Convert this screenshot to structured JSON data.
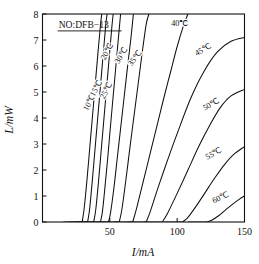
{
  "figure": {
    "annotation": "NO:DFB−13",
    "background": "#ffffff",
    "line_color": "#111111"
  },
  "chart_data": {
    "type": "line",
    "title": "",
    "subtitle": "",
    "xlabel": "I/mA",
    "ylabel": "L/mW",
    "xlim": [
      0,
      150
    ],
    "ylim": [
      0,
      8
    ],
    "xticks": [
      50,
      100,
      150
    ],
    "xtick_labels": [
      "50",
      "100",
      "150"
    ],
    "yticks": [
      0,
      1,
      2,
      3,
      4,
      5,
      6,
      7,
      8
    ],
    "ytick_labels": [
      "0",
      "1",
      "2",
      "3",
      "4",
      "5",
      "6",
      "7",
      "8"
    ],
    "grid": false,
    "legend": "inline-curve-labels",
    "annotations": [
      {
        "text": "NO:DFB−13",
        "x": 12,
        "y": 7.45,
        "underline": true
      }
    ],
    "series": [
      {
        "name": "10°C",
        "label": "10℃",
        "threshold_mA": 29.5,
        "slope_mW_per_mA": 0.62,
        "label_x": 36.5,
        "label_y": 4.55,
        "label_rotation": -61,
        "points": [
          [
            29.5,
            0
          ],
          [
            31,
            0.55
          ],
          [
            33,
            1.6
          ],
          [
            35,
            2.8
          ],
          [
            37,
            4.0
          ],
          [
            39,
            5.2
          ],
          [
            41,
            6.4
          ],
          [
            43,
            7.55
          ],
          [
            44,
            8.0
          ]
        ]
      },
      {
        "name": "15°C",
        "label": "15℃",
        "threshold_mA": 33.5,
        "slope_mW_per_mA": 0.6,
        "label_x": 41.5,
        "label_y": 5.1,
        "label_rotation": -61,
        "points": [
          [
            33.5,
            0
          ],
          [
            35,
            0.5
          ],
          [
            37,
            1.6
          ],
          [
            39,
            2.8
          ],
          [
            41,
            4.0
          ],
          [
            43,
            5.2
          ],
          [
            45,
            6.4
          ],
          [
            47,
            7.6
          ],
          [
            48,
            8.0
          ]
        ]
      },
      {
        "name": "20°C",
        "label": "20℃",
        "threshold_mA": 38,
        "slope_mW_per_mA": 0.585,
        "label_x": 49.5,
        "label_y": 6.5,
        "label_rotation": -61,
        "points": [
          [
            38,
            0
          ],
          [
            39.5,
            0.45
          ],
          [
            41.5,
            1.5
          ],
          [
            43.5,
            2.7
          ],
          [
            45.5,
            3.9
          ],
          [
            47.5,
            5.1
          ],
          [
            49.5,
            6.3
          ],
          [
            51.5,
            7.5
          ],
          [
            52.5,
            8.0
          ]
        ]
      },
      {
        "name": "25°C",
        "label": "25℃",
        "threshold_mA": 43,
        "slope_mW_per_mA": 0.555,
        "label_x": 49,
        "label_y": 5.0,
        "label_rotation": -61,
        "points": [
          [
            43,
            0
          ],
          [
            44.5,
            0.4
          ],
          [
            46.5,
            1.4
          ],
          [
            48.5,
            2.5
          ],
          [
            50.5,
            3.7
          ],
          [
            52.5,
            4.85
          ],
          [
            54.5,
            6.0
          ],
          [
            56.5,
            7.15
          ],
          [
            58,
            8.0
          ]
        ]
      },
      {
        "name": "30°C",
        "label": "30℃",
        "threshold_mA": 49,
        "slope_mW_per_mA": 0.52,
        "label_x": 60,
        "label_y": 6.35,
        "label_rotation": -58,
        "points": [
          [
            49,
            0
          ],
          [
            50.5,
            0.35
          ],
          [
            53,
            1.3
          ],
          [
            55.5,
            2.45
          ],
          [
            58,
            3.6
          ],
          [
            60.5,
            4.75
          ],
          [
            63,
            5.9
          ],
          [
            65.5,
            7.0
          ],
          [
            67.5,
            8.0
          ]
        ]
      },
      {
        "name": "35°C",
        "label": "35℃",
        "threshold_mA": 57,
        "slope_mW_per_mA": 0.46,
        "label_x": 70,
        "label_y": 6.25,
        "label_rotation": -55,
        "points": [
          [
            57,
            0
          ],
          [
            59,
            0.5
          ],
          [
            62,
            1.65
          ],
          [
            65,
            2.9
          ],
          [
            68,
            4.1
          ],
          [
            71,
            5.3
          ],
          [
            74,
            6.5
          ],
          [
            77,
            7.6
          ],
          [
            79,
            8.0
          ]
        ]
      },
      {
        "name": "40°C",
        "label": "40℃",
        "threshold_mA": 67,
        "slope_mW_per_mA": 0.385,
        "label_x": 102,
        "label_y": 7.55,
        "label_rotation": 0,
        "points": [
          [
            67,
            0
          ],
          [
            70,
            0.55
          ],
          [
            75,
            1.6
          ],
          [
            80,
            2.65
          ],
          [
            85,
            3.7
          ],
          [
            90,
            4.75
          ],
          [
            95,
            5.75
          ],
          [
            100,
            6.75
          ],
          [
            105,
            7.6
          ],
          [
            108,
            8.0
          ]
        ]
      },
      {
        "name": "45°C",
        "label": "45℃",
        "threshold_mA": 77,
        "slope_mW_per_mA": 0.3,
        "label_x": 120,
        "label_y": 6.55,
        "label_rotation": -30,
        "points": [
          [
            77,
            0
          ],
          [
            80,
            0.4
          ],
          [
            86,
            1.35
          ],
          [
            93,
            2.4
          ],
          [
            100,
            3.4
          ],
          [
            110,
            4.75
          ],
          [
            120,
            5.8
          ],
          [
            130,
            6.55
          ],
          [
            140,
            6.95
          ],
          [
            150,
            7.1
          ]
        ]
      },
      {
        "name": "50°C",
        "label": "50℃",
        "threshold_mA": 89,
        "slope_mW_per_mA": 0.24,
        "label_x": 126,
        "label_y": 4.45,
        "label_rotation": -32,
        "points": [
          [
            89,
            0
          ],
          [
            93,
            0.35
          ],
          [
            100,
            1.1
          ],
          [
            108,
            2.0
          ],
          [
            116,
            2.9
          ],
          [
            124,
            3.7
          ],
          [
            132,
            4.4
          ],
          [
            140,
            4.85
          ],
          [
            150,
            5.1
          ]
        ]
      },
      {
        "name": "55°C",
        "label": "55℃",
        "threshold_mA": 104,
        "slope_mW_per_mA": 0.155,
        "label_x": 128,
        "label_y": 2.55,
        "label_rotation": -28,
        "points": [
          [
            104,
            0
          ],
          [
            108,
            0.18
          ],
          [
            114,
            0.6
          ],
          [
            121,
            1.15
          ],
          [
            128,
            1.7
          ],
          [
            135,
            2.2
          ],
          [
            142,
            2.6
          ],
          [
            150,
            2.9
          ]
        ]
      },
      {
        "name": "60°C",
        "label": "60℃",
        "threshold_mA": 122,
        "slope_mW_per_mA": 0.075,
        "label_x": 133,
        "label_y": 0.85,
        "label_rotation": -24,
        "points": [
          [
            122,
            0
          ],
          [
            126,
            0.08
          ],
          [
            131,
            0.25
          ],
          [
            136,
            0.47
          ],
          [
            141,
            0.68
          ],
          [
            146,
            0.87
          ],
          [
            150,
            1.0
          ]
        ]
      }
    ]
  }
}
